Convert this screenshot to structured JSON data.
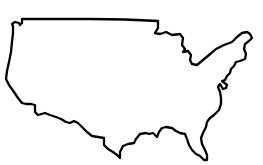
{
  "map": {
    "subject": "United States (contiguous) outline",
    "background_color": "#ffffff",
    "stroke_color": "#000000",
    "labels": []
  }
}
